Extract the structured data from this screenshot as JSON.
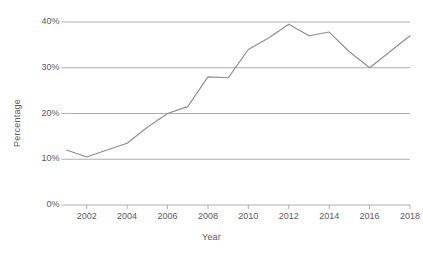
{
  "chart_data": {
    "type": "line",
    "title": "",
    "xlabel": "Year",
    "ylabel": "Percentage",
    "x": [
      2001,
      2002,
      2003,
      2004,
      2005,
      2006,
      2007,
      2008,
      2009,
      2010,
      2011,
      2012,
      2013,
      2014,
      2015,
      2016,
      2017,
      2018
    ],
    "series": [
      {
        "name": "Percentage",
        "values": [
          12.0,
          10.5,
          12.0,
          13.5,
          17.0,
          20.0,
          21.5,
          28.0,
          27.8,
          34.0,
          36.5,
          39.5,
          37.0,
          37.8,
          33.5,
          30.0,
          33.5,
          37.0
        ]
      }
    ],
    "xlim": [
      2001,
      2018
    ],
    "ylim": [
      0,
      40
    ],
    "x_tick_labels": [
      "2002",
      "2004",
      "2006",
      "2008",
      "2010",
      "2012",
      "2014",
      "2016",
      "2018"
    ],
    "x_tick_values": [
      2002,
      2004,
      2006,
      2008,
      2010,
      2012,
      2014,
      2016,
      2018
    ],
    "y_tick_labels": [
      "0%",
      "10%",
      "20%",
      "30%",
      "40%"
    ],
    "y_tick_values": [
      0,
      10,
      20,
      30,
      40
    ],
    "grid": "horizontal",
    "legend": "none",
    "line_color": "#8c8c8c",
    "gridline_color": "#a6a6a6",
    "axis_color": "#a6a6a6",
    "text_color": "#5a5a5a",
    "background_color": "#ffffff",
    "markers": "none"
  }
}
